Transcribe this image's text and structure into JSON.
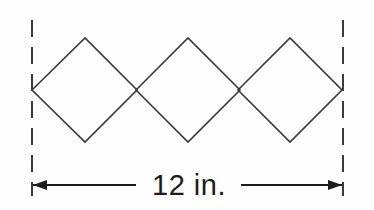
{
  "figure": {
    "type": "geometry-dimension-diagram",
    "background_color": "#fefefe",
    "stroke_color": "#3a3a3a",
    "text_color": "#1c1c1c"
  },
  "dimension": {
    "label": "12 in.",
    "value": 12,
    "unit": "in.",
    "measures": "total width of the three-diamond row",
    "label_x": 189,
    "label_y": 185
  },
  "extension_lines": {
    "stroke_color": "#3a3a3a",
    "stroke_width": 2,
    "dash_pattern": "17 10",
    "left": {
      "x": 32,
      "y_top": 20,
      "y_bottom": 196
    },
    "right": {
      "x": 343,
      "y_top": 20,
      "y_bottom": 196
    }
  },
  "dimension_line": {
    "y": 185,
    "stroke_color": "#1c1c1c",
    "stroke_width": 2,
    "left_segment": {
      "x_start": 33,
      "x_end": 136
    },
    "right_segment": {
      "x_start": 241,
      "x_end": 342
    },
    "left_arrow": {
      "tip_x": 33,
      "direction": "left"
    },
    "right_arrow": {
      "tip_x": 342,
      "direction": "right"
    },
    "arrow_length": 14,
    "arrow_half_width": 5
  },
  "diamonds": {
    "count": 3,
    "stroke_color": "#3a3a3a",
    "stroke_width": 1.6,
    "fill": "none",
    "center_y": 90,
    "half_width": 52,
    "half_height": 52,
    "items": [
      {
        "index": 1,
        "name": "diamond-left",
        "center_x": 85,
        "left_vertex": [
          32,
          90
        ],
        "top_vertex": [
          85,
          38
        ],
        "right_vertex": [
          137,
          90
        ],
        "bottom_vertex": [
          85,
          142
        ]
      },
      {
        "index": 2,
        "name": "diamond-middle",
        "center_x": 188,
        "left_vertex": [
          136,
          90
        ],
        "top_vertex": [
          188,
          38
        ],
        "right_vertex": [
          240,
          90
        ],
        "bottom_vertex": [
          188,
          142
        ]
      },
      {
        "index": 3,
        "name": "diamond-right",
        "center_x": 290,
        "left_vertex": [
          238,
          90
        ],
        "top_vertex": [
          290,
          38
        ],
        "right_vertex": [
          342,
          90
        ],
        "bottom_vertex": [
          290,
          142
        ]
      }
    ]
  },
  "intersections": [
    {
      "name": "crossing-1-2",
      "x": 136,
      "y": 90
    },
    {
      "name": "crossing-2-3",
      "x": 239,
      "y": 90
    }
  ]
}
